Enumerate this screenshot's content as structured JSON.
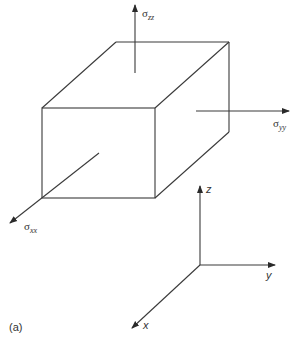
{
  "figure": {
    "panel_label": "(a)",
    "stress_labels": {
      "zz": {
        "symbol": "σ",
        "subscript": "zz"
      },
      "yy": {
        "symbol": "σ",
        "subscript": "yy"
      },
      "xx": {
        "symbol": "σ",
        "subscript": "xx"
      }
    },
    "axes": {
      "z": "z",
      "y": "y",
      "x": "x"
    },
    "line_color": "#3a3a3a",
    "background": "#ffffff"
  }
}
